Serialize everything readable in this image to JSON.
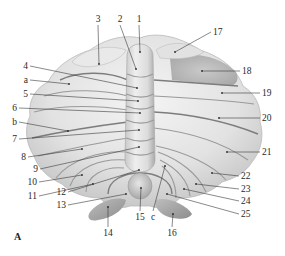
{
  "figure": {
    "panel_label": "A",
    "colors": {
      "background": "#ffffff",
      "tissue_light": "#ececec",
      "tissue_mid": "#d6d6d6",
      "tissue_dark": "#b5b5b5",
      "fissure": "#8f8f8f",
      "label_text": "#2a2a2a"
    },
    "labels": [
      {
        "id": "1",
        "text": "1",
        "tx": 139,
        "ty": 22,
        "px": 140,
        "py": 52
      },
      {
        "id": "2",
        "text": "2",
        "tx": 120,
        "ty": 22,
        "px": 136,
        "py": 69
      },
      {
        "id": "3",
        "text": "3",
        "tx": 98,
        "ty": 22,
        "px": 99,
        "py": 64
      },
      {
        "id": "4",
        "text": "4",
        "tx": 28,
        "ty": 69,
        "px": 137,
        "py": 88
      },
      {
        "id": "a",
        "text": "a",
        "tx": 28,
        "ty": 83,
        "px": 69,
        "py": 84
      },
      {
        "id": "5",
        "text": "5",
        "tx": 28,
        "ty": 97,
        "px": 138,
        "py": 101
      },
      {
        "id": "6",
        "text": "6",
        "tx": 17,
        "ty": 111,
        "px": 140,
        "py": 113
      },
      {
        "id": "b",
        "text": "b",
        "tx": 17,
        "ty": 125,
        "px": 68,
        "py": 131
      },
      {
        "id": "7",
        "text": "7",
        "tx": 17,
        "ty": 142,
        "px": 139,
        "py": 130
      },
      {
        "id": "8",
        "text": "8",
        "tx": 26,
        "ty": 160,
        "px": 82,
        "py": 149
      },
      {
        "id": "9",
        "text": "9",
        "tx": 38,
        "ty": 172,
        "px": 139,
        "py": 147
      },
      {
        "id": "10",
        "text": "10",
        "tx": 37,
        "ty": 185,
        "px": 82,
        "py": 175
      },
      {
        "id": "11",
        "text": "11",
        "tx": 37,
        "ty": 199,
        "px": 93,
        "py": 184
      },
      {
        "id": "12",
        "text": "12",
        "tx": 66,
        "ty": 195,
        "px": 139,
        "py": 170
      },
      {
        "id": "13",
        "text": "13",
        "tx": 66,
        "ty": 208,
        "px": 126,
        "py": 194
      },
      {
        "id": "14",
        "text": "14",
        "tx": 108,
        "ty": 236,
        "px": 108,
        "py": 207
      },
      {
        "id": "15",
        "text": "15",
        "tx": 140,
        "ty": 220,
        "px": 141,
        "py": 188
      },
      {
        "id": "c",
        "text": "c",
        "tx": 153,
        "ty": 220,
        "px": 165,
        "py": 166
      },
      {
        "id": "16",
        "text": "16",
        "tx": 172,
        "ty": 236,
        "px": 173,
        "py": 214
      },
      {
        "id": "17",
        "text": "17",
        "tx": 213,
        "ty": 35,
        "px": 175,
        "py": 52
      },
      {
        "id": "18",
        "text": "18",
        "tx": 242,
        "ty": 74,
        "px": 202,
        "py": 71
      },
      {
        "id": "19",
        "text": "19",
        "tx": 262,
        "ty": 96,
        "px": 222,
        "py": 93
      },
      {
        "id": "20",
        "text": "20",
        "tx": 262,
        "ty": 121,
        "px": 219,
        "py": 118
      },
      {
        "id": "21",
        "text": "21",
        "tx": 262,
        "ty": 155,
        "px": 227,
        "py": 152
      },
      {
        "id": "22",
        "text": "22",
        "tx": 241,
        "ty": 179,
        "px": 212,
        "py": 173
      },
      {
        "id": "23",
        "text": "23",
        "tx": 241,
        "ty": 192,
        "px": 196,
        "py": 184
      },
      {
        "id": "24",
        "text": "24",
        "tx": 241,
        "ty": 204,
        "px": 184,
        "py": 189
      },
      {
        "id": "25",
        "text": "25",
        "tx": 241,
        "ty": 217,
        "px": 167,
        "py": 194
      }
    ]
  }
}
